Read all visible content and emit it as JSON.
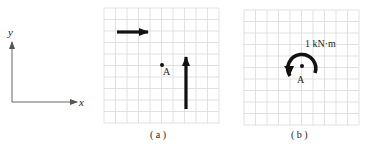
{
  "axes": {
    "x_label": "x",
    "y_label": "y"
  },
  "panel_a": {
    "caption": "( a )",
    "point_label": "A",
    "grid": {
      "x": 104,
      "y": 8,
      "cols": 10,
      "rows": 10,
      "cell": 11.5
    },
    "forces": [
      {
        "name": "horizontal-force",
        "direction": "right"
      },
      {
        "name": "vertical-force",
        "direction": "up"
      }
    ]
  },
  "panel_b": {
    "caption": "( b )",
    "point_label": "A",
    "moment_label": "1 kN·m",
    "moment_direction": "counterclockwise",
    "grid": {
      "x": 244,
      "y": 10,
      "cols": 10,
      "rows": 10,
      "cell": 11.5
    }
  },
  "colors": {
    "grid": "#d9d9d9",
    "ink": "#111111"
  }
}
